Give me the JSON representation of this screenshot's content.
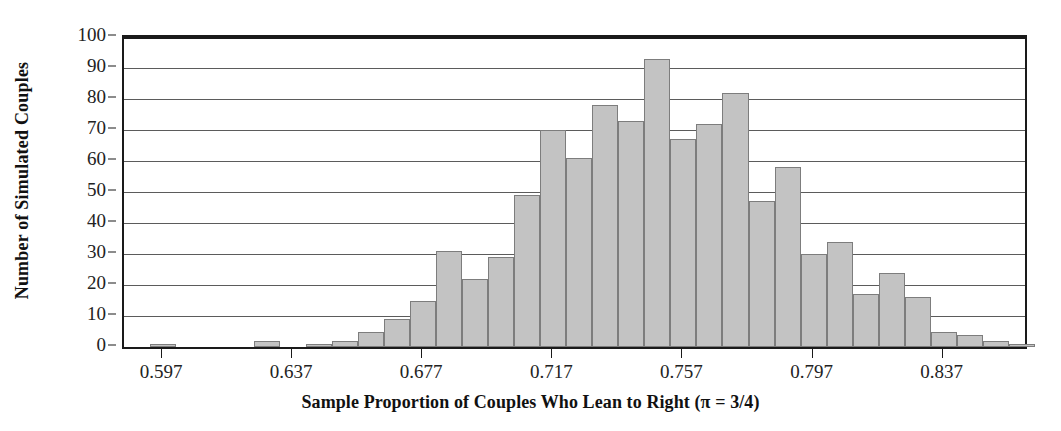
{
  "chart_data": {
    "type": "bar",
    "title": "",
    "subtitle": "",
    "xlabel": "Sample Proportion of Couples Who Lean to Right (π = 3/4)",
    "ylabel": "Number of Simulated Couples",
    "ylim": [
      0,
      100
    ],
    "xlim": [
      0.585,
      0.862
    ],
    "bin_width": 0.008,
    "grid": true,
    "legend": null,
    "y_ticks": [
      0,
      10,
      20,
      30,
      40,
      50,
      60,
      70,
      80,
      90,
      100
    ],
    "x_ticks": [
      0.597,
      0.637,
      0.677,
      0.717,
      0.757,
      0.797,
      0.837
    ],
    "x_tick_labels": [
      "0.597",
      "0.637",
      "0.677",
      "0.717",
      "0.757",
      "0.797",
      "0.837"
    ],
    "bar_color": "#c3c3c3",
    "bar_edge_color": "#7d7d7d",
    "axis_color": "#1a1a1a",
    "grid_color": "#5b5b5b",
    "bins": [
      {
        "left": 0.593,
        "right": 0.601,
        "value": 1
      },
      {
        "left": 0.601,
        "right": 0.609,
        "value": 0
      },
      {
        "left": 0.609,
        "right": 0.617,
        "value": 0
      },
      {
        "left": 0.617,
        "right": 0.625,
        "value": 0
      },
      {
        "left": 0.625,
        "right": 0.633,
        "value": 2
      },
      {
        "left": 0.633,
        "right": 0.641,
        "value": 0
      },
      {
        "left": 0.641,
        "right": 0.649,
        "value": 1
      },
      {
        "left": 0.649,
        "right": 0.657,
        "value": 2
      },
      {
        "left": 0.657,
        "right": 0.665,
        "value": 5
      },
      {
        "left": 0.665,
        "right": 0.673,
        "value": 9
      },
      {
        "left": 0.673,
        "right": 0.681,
        "value": 15
      },
      {
        "left": 0.681,
        "right": 0.689,
        "value": 31
      },
      {
        "left": 0.689,
        "right": 0.697,
        "value": 22
      },
      {
        "left": 0.697,
        "right": 0.705,
        "value": 29
      },
      {
        "left": 0.705,
        "right": 0.713,
        "value": 49
      },
      {
        "left": 0.713,
        "right": 0.721,
        "value": 70
      },
      {
        "left": 0.721,
        "right": 0.729,
        "value": 61
      },
      {
        "left": 0.729,
        "right": 0.737,
        "value": 78
      },
      {
        "left": 0.737,
        "right": 0.745,
        "value": 73
      },
      {
        "left": 0.745,
        "right": 0.753,
        "value": 93
      },
      {
        "left": 0.753,
        "right": 0.761,
        "value": 67
      },
      {
        "left": 0.761,
        "right": 0.769,
        "value": 72
      },
      {
        "left": 0.769,
        "right": 0.777,
        "value": 82
      },
      {
        "left": 0.777,
        "right": 0.785,
        "value": 47
      },
      {
        "left": 0.785,
        "right": 0.793,
        "value": 58
      },
      {
        "left": 0.793,
        "right": 0.801,
        "value": 30
      },
      {
        "left": 0.801,
        "right": 0.809,
        "value": 34
      },
      {
        "left": 0.809,
        "right": 0.817,
        "value": 17
      },
      {
        "left": 0.817,
        "right": 0.825,
        "value": 24
      },
      {
        "left": 0.825,
        "right": 0.833,
        "value": 16
      },
      {
        "left": 0.833,
        "right": 0.841,
        "value": 5
      },
      {
        "left": 0.841,
        "right": 0.849,
        "value": 4
      },
      {
        "left": 0.849,
        "right": 0.857,
        "value": 2
      },
      {
        "left": 0.857,
        "right": 0.865,
        "value": 1
      }
    ]
  }
}
